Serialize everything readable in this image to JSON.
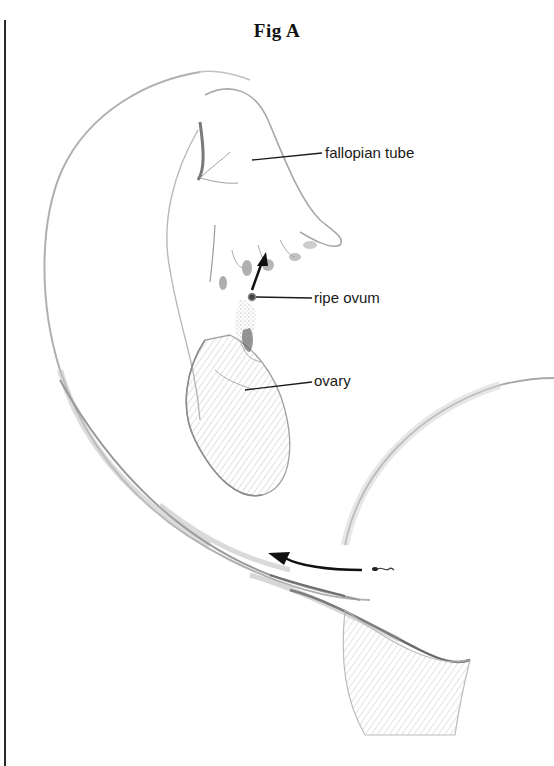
{
  "figure": {
    "title": "Fig A",
    "labels": {
      "fallopian_tube": "fallopian tube",
      "ripe_ovum": "ripe ovum",
      "ovary": "ovary"
    },
    "annotations": {
      "ovum_arrow": "arrow-up-right",
      "sperm_arrow": "arrow-left",
      "sperm_icon": "sperm"
    }
  },
  "colors": {
    "ink": "#1a1a1a",
    "pencil": "#9a9a9a",
    "shade": "#c8c8c8",
    "background": "#ffffff"
  }
}
